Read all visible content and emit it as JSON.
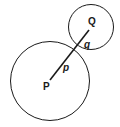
{
  "diagram": {
    "type": "tangent-circles",
    "large_circle": {
      "center_label": "P",
      "radius_label": "p"
    },
    "small_circle": {
      "center_label": "Q",
      "radius_label": "q"
    },
    "colors": {
      "stroke": "#1a1a1a",
      "background": "#ffffff"
    }
  }
}
